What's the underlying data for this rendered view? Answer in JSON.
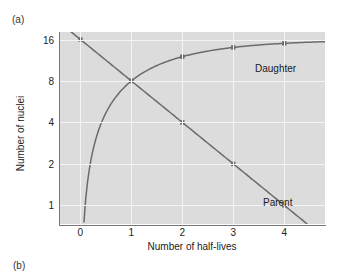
{
  "figure": {
    "panel_a_label": "(a)",
    "panel_b_label": "(b)"
  },
  "chart_data": {
    "type": "line",
    "title": "",
    "xlabel": "Number of half-lives",
    "ylabel": "Number of nuclei",
    "xlim": [
      -0.42,
      4.8
    ],
    "ylim_log2": [
      -0.45,
      4.18
    ],
    "grid": true,
    "legend_position": "inline-annotation",
    "xticks": [
      0,
      1,
      2,
      3,
      4
    ],
    "xtick_labels": [
      "0",
      "1",
      "2",
      "3",
      "4"
    ],
    "yticks": [
      1,
      2,
      4,
      8,
      16
    ],
    "ytick_labels": [
      "1",
      "2",
      "4",
      "8",
      "16"
    ],
    "y_scale": "log2",
    "series": [
      {
        "name": "Parent",
        "label": "Parent",
        "color": "#6b6b6b",
        "marker": "square",
        "x": [
          0,
          1,
          2,
          3,
          4
        ],
        "values": [
          16,
          8,
          4,
          2,
          1
        ]
      },
      {
        "name": "Daughter",
        "label": "Daughter",
        "color": "#6b6b6b",
        "marker": "square",
        "x": [
          0,
          1,
          2,
          3,
          4
        ],
        "values": [
          0,
          8,
          12,
          14,
          15
        ]
      }
    ],
    "annotations": [
      {
        "text": "Daughter",
        "x": 3.5,
        "y": 13.5
      },
      {
        "text": "Parent",
        "x": 3.6,
        "y": 1.7
      }
    ],
    "colors": {
      "plot_background": "#dcdcdc",
      "gridline": "#f4f4f4",
      "axis": "#777777",
      "curve": "#6b6b6b",
      "text": "#1a1a1a"
    }
  }
}
